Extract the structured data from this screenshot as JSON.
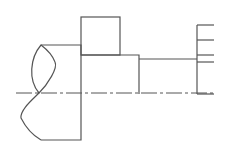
{
  "diagram": {
    "type": "technical-drawing",
    "colors": {
      "stroke": "#555555",
      "background": "#ffffff"
    }
  }
}
